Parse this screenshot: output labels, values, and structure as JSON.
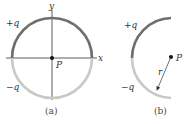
{
  "figure_a": {
    "caption": "(a)",
    "axis_x_label": "x",
    "axis_y_label": "y",
    "point_label": "P",
    "top_charge_label": "+q",
    "bottom_charge_label": "−q",
    "colors": {
      "positive_half": "#6e6e6e",
      "negative_half": "#c8c8c8",
      "axes": "#333333"
    }
  },
  "figure_b": {
    "caption": "(b)",
    "point_label": "P",
    "radius_label": "r",
    "top_charge_label": "+q",
    "bottom_charge_label": "−q",
    "colors": {
      "positive_half": "#6e6e6e",
      "negative_half": "#c8c8c8"
    }
  }
}
